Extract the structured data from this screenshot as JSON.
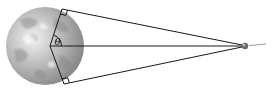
{
  "diagram": {
    "title": "",
    "angle_label": "θ",
    "elements": [
      {
        "name": "planet",
        "type": "sphere",
        "description": "Textured gray globe (Earth/planet)"
      },
      {
        "name": "observer",
        "type": "spacecraft",
        "description": "Small object far to the right where lines converge"
      },
      {
        "name": "tangent-line-top",
        "type": "line"
      },
      {
        "name": "tangent-line-bottom",
        "type": "line"
      },
      {
        "name": "center-line",
        "type": "line"
      },
      {
        "name": "radius-top",
        "type": "line"
      },
      {
        "name": "radius-bottom",
        "type": "line"
      },
      {
        "name": "right-angle-top",
        "type": "marker"
      },
      {
        "name": "right-angle-bottom",
        "type": "marker"
      },
      {
        "name": "angle-arc",
        "type": "arc",
        "label": "θ"
      }
    ],
    "colors": {
      "line": "#1a1a1a",
      "planet_light": "#e6e6e6",
      "planet_dark": "#7d7d7d"
    }
  }
}
